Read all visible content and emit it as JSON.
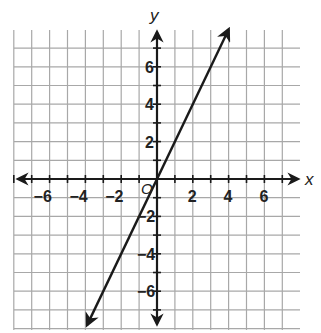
{
  "chart_data": {
    "type": "line",
    "title": "",
    "xlabel": "x",
    "ylabel": "y",
    "origin_label": "O",
    "xlim": [
      -8,
      7
    ],
    "ylim": [
      -8,
      8
    ],
    "grid": true,
    "grid_step": 1,
    "x_ticks": [
      -6,
      -4,
      -2,
      2,
      4,
      6
    ],
    "y_ticks": [
      -6,
      -4,
      -2,
      2,
      4,
      6
    ],
    "x_tick_labels": [
      "−6",
      "−4",
      "−2",
      "2",
      "4",
      "6"
    ],
    "y_tick_labels": [
      "−6",
      "−4",
      "−2",
      "2",
      "4",
      "6"
    ],
    "series": [
      {
        "name": "y = 2x",
        "equation": "y = 2x",
        "slope": 2,
        "intercept": 0,
        "x": [
          -3.9,
          0,
          4
        ],
        "y": [
          -7.8,
          0,
          8
        ],
        "arrows_both_ends": true
      }
    ]
  }
}
